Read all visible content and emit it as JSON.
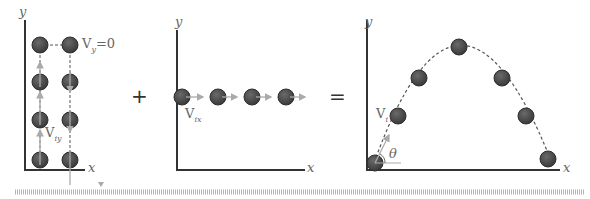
{
  "panels": {
    "vertical": {
      "y_label": "y",
      "x_label": "x",
      "top_label_v": "V",
      "top_label_sub": "y",
      "top_label_rest": "=0",
      "vel_label_v": "V",
      "vel_label_sub": "iy"
    },
    "horizontal": {
      "y_label": "y",
      "x_label": "x",
      "vel_label_v": "V",
      "vel_label_sub": "ix"
    },
    "projectile": {
      "y_label": "y",
      "x_label": "x",
      "vel_label_v": "V",
      "vel_label_sub": "i",
      "angle_label": "θ"
    }
  },
  "operators": {
    "plus": "+",
    "equals": "="
  },
  "colors": {
    "ball": "#4a4a4a",
    "axis": "#333333",
    "arrow": "#aaaaaa",
    "dash": "#555555",
    "ruler": "#b5b5b5"
  }
}
